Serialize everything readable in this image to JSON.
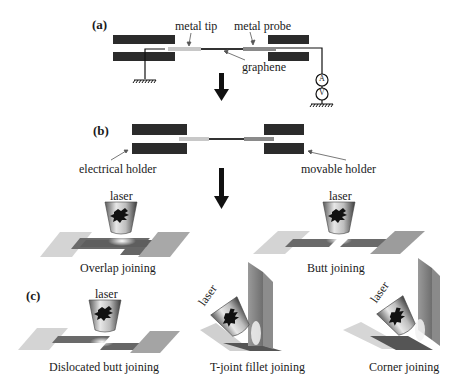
{
  "figure": {
    "panel_a": {
      "label": "(a)",
      "annotations": {
        "metal_tip": "metal tip",
        "metal_probe": "metal probe",
        "graphene": "graphene"
      },
      "meters": [
        "A",
        "V"
      ]
    },
    "panel_b": {
      "label": "(b)",
      "annotations": {
        "electrical_holder": "electrical holder",
        "movable_holder": "movable holder"
      }
    },
    "panel_c": {
      "label": "(c)",
      "laser_label": "laser",
      "joints": [
        {
          "name": "Overlap joining"
        },
        {
          "name": "Butt joining"
        },
        {
          "name": "Dislocated butt joining"
        },
        {
          "name": "T-joint fillet joining"
        },
        {
          "name": "Corner joining"
        }
      ]
    },
    "colors": {
      "holder": "#2b2b2b",
      "metal_tip": "#c8c8c8",
      "metal_probe": "#8a8a8a",
      "graphene": "#333333",
      "plate_light": "#d4d4d4",
      "plate_dark": "#6a6a6a",
      "arrow": "#111111"
    }
  }
}
